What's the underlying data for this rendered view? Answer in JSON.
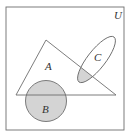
{
  "diagram": {
    "type": "venn",
    "universe_label": "U",
    "sets": [
      {
        "id": "A",
        "label": "A",
        "shape": "triangle"
      },
      {
        "id": "B",
        "label": "B",
        "shape": "circle"
      },
      {
        "id": "C",
        "label": "C",
        "shape": "ellipse"
      }
    ],
    "shaded_regions": [
      "B",
      "A ∩ C"
    ],
    "colors": {
      "stroke": "#6e6e6e",
      "shade": "#d4d4d4",
      "background": "#ffffff"
    }
  }
}
